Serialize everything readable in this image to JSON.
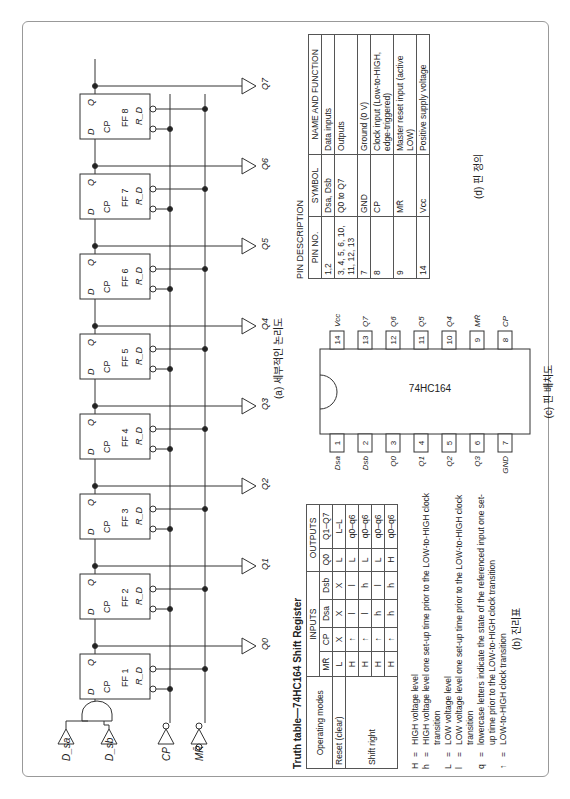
{
  "logic_diagram": {
    "caption": "(a) 세부적인 논리도",
    "inputs": [
      "D_sa",
      "D_sb",
      "CP",
      "MR̄"
    ],
    "flipflops": [
      {
        "name": "FF 1",
        "pins": {
          "d": "D",
          "q": "Q",
          "cp": "CP",
          "rd": "R_D"
        }
      },
      {
        "name": "FF 2",
        "pins": {
          "d": "D",
          "q": "Q",
          "cp": "CP",
          "rd": "R_D"
        }
      },
      {
        "name": "FF 3",
        "pins": {
          "d": "D",
          "q": "Q",
          "cp": "CP",
          "rd": "R_D"
        }
      },
      {
        "name": "FF 4",
        "pins": {
          "d": "D",
          "q": "Q",
          "cp": "CP",
          "rd": "R_D"
        }
      },
      {
        "name": "FF 5",
        "pins": {
          "d": "D",
          "q": "Q",
          "cp": "CP",
          "rd": "R_D"
        }
      },
      {
        "name": "FF 6",
        "pins": {
          "d": "D",
          "q": "Q",
          "cp": "CP",
          "rd": "R_D"
        }
      },
      {
        "name": "FF 7",
        "pins": {
          "d": "D",
          "q": "Q",
          "cp": "CP",
          "rd": "R_D"
        }
      },
      {
        "name": "FF 8",
        "pins": {
          "d": "D",
          "q": "Q",
          "cp": "CP",
          "rd": "R_D"
        }
      }
    ],
    "outputs": [
      "Q0",
      "Q1",
      "Q2",
      "Q3",
      "Q4",
      "Q5",
      "Q6",
      "Q7"
    ]
  },
  "truth_table": {
    "title": "Truth table—74HC164 Shift Register",
    "headers": {
      "modes": "Operating modes",
      "inputs": "INPUTS",
      "outputs": "OUTPUTS",
      "mr": "MR̄",
      "cp": "CP",
      "dsa": "Dsa",
      "dsb": "Dsb",
      "q0": "Q0",
      "q1q7": "Q1–Q7"
    },
    "rows": [
      {
        "mode": "Reset (clear)",
        "mr": "L",
        "cp": "X",
        "dsa": "X",
        "dsb": "X",
        "q0": "L",
        "q1q7": "L–L"
      },
      {
        "mode": "Shift right",
        "mr": "H",
        "cp": "↑",
        "dsa": "l",
        "dsb": "l",
        "q0": "L",
        "q1q7": "q0–q6"
      },
      {
        "mode": "",
        "mr": "H",
        "cp": "↑",
        "dsa": "l",
        "dsb": "h",
        "q0": "L",
        "q1q7": "q0–q6"
      },
      {
        "mode": "",
        "mr": "H",
        "cp": "↑",
        "dsa": "h",
        "dsb": "l",
        "q0": "L",
        "q1q7": "q0–q6"
      },
      {
        "mode": "",
        "mr": "H",
        "cp": "↑",
        "dsa": "h",
        "dsb": "h",
        "q0": "H",
        "q1q7": "q0–q6"
      }
    ],
    "legend": [
      {
        "sym": "H",
        "desc": "HIGH voltage level"
      },
      {
        "sym": "h",
        "desc": "HIGH voltage level one set-up time prior to the LOW-to-HIGH clock transition"
      },
      {
        "sym": "L",
        "desc": "LOW voltage level"
      },
      {
        "sym": "l",
        "desc": "LOW voltage level one set-up time prior to the LOW-to-HIGH clock transition"
      },
      {
        "sym": "q",
        "desc": "lowercase letters indicate the state of the referenced input one set-up time prior to the LOW-to-HIGH clock transition"
      },
      {
        "sym": "↑",
        "desc": "LOW-to-HIGH clock transition"
      }
    ],
    "caption": "(b) 진리표"
  },
  "pin_diagram": {
    "chip_label": "74HC164",
    "caption": "(c) 핀 배치도",
    "left_pins": [
      {
        "num": "1",
        "name": "Dsa"
      },
      {
        "num": "2",
        "name": "Dsb"
      },
      {
        "num": "3",
        "name": "Q0"
      },
      {
        "num": "4",
        "name": "Q1"
      },
      {
        "num": "5",
        "name": "Q2"
      },
      {
        "num": "6",
        "name": "Q3"
      },
      {
        "num": "7",
        "name": "GND"
      }
    ],
    "right_pins": [
      {
        "num": "14",
        "name": "Vcc"
      },
      {
        "num": "13",
        "name": "Q7"
      },
      {
        "num": "12",
        "name": "Q6"
      },
      {
        "num": "11",
        "name": "Q5"
      },
      {
        "num": "10",
        "name": "Q4"
      },
      {
        "num": "9",
        "name": "MR̄"
      },
      {
        "num": "8",
        "name": "CP"
      }
    ]
  },
  "pin_description": {
    "title": "PIN DESCRIPTION",
    "headers": [
      "PIN NO.",
      "SYMBOL",
      "NAME AND FUNCTION"
    ],
    "rows": [
      {
        "pin": "1,2",
        "symbol": "Dsa, Dsb",
        "function": "Data inputs"
      },
      {
        "pin": "3, 4, 5, 6, 10, 11, 12, 13",
        "symbol": "Q0 to Q7",
        "function": "Outputs"
      },
      {
        "pin": "7",
        "symbol": "GND",
        "function": "Ground (0 V)"
      },
      {
        "pin": "8",
        "symbol": "CP",
        "function": "Clock input (Low-to-HIGH, edge-triggered)"
      },
      {
        "pin": "9",
        "symbol": "MR̄",
        "function": "Master reset input (active LOW)"
      },
      {
        "pin": "14",
        "symbol": "Vcc",
        "function": "Positive supply voltage"
      }
    ],
    "caption": "(d) 핀 정의"
  }
}
